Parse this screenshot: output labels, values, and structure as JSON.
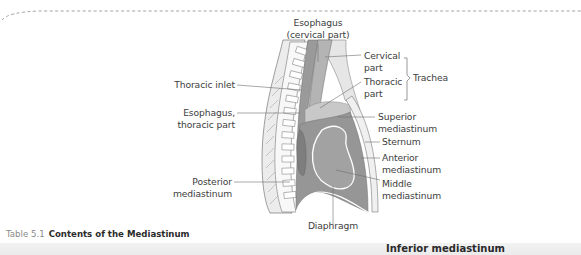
{
  "figure": {
    "labels": {
      "esophagus_cervical": [
        "Esophagus",
        "(cervical part)"
      ],
      "thoracic_inlet": "Thoracic inlet",
      "esophagus_thoracic": [
        "Esophagus,",
        "thoracic part"
      ],
      "posterior_mediastinum": [
        "Posterior",
        "mediastinum"
      ],
      "cervical_part": [
        "Cervical",
        "part"
      ],
      "thoracic_part": [
        "Thoracic",
        "part"
      ],
      "trachea": "Trachea",
      "superior_mediastinum": [
        "Superior",
        "mediastinum"
      ],
      "sternum": "Sternum",
      "anterior_mediastinum": [
        "Anterior",
        "mediastinum"
      ],
      "middle_mediastinum": [
        "Middle",
        "mediastinum"
      ],
      "diaphragm": "Diaphragm"
    },
    "colors": {
      "dark_region": "#8f8f8f",
      "mid_region": "#a6a6a6",
      "light_region": "#c4c4c4",
      "pale_region": "#e2e2e2",
      "line": "#7a7a7a"
    }
  },
  "caption": {
    "number": "Table 5.1",
    "title": "Contents of the Mediastinum"
  },
  "table": {
    "column_header": "Inferior mediastinum"
  }
}
